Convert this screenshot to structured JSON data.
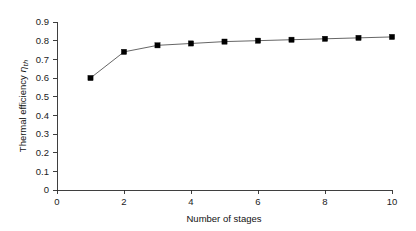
{
  "chart_data": {
    "type": "line",
    "title": "",
    "subtitle": "",
    "xlabel": "Number of stages",
    "ylabel": "Thermal efficiency",
    "ylabel_symbol": "η",
    "ylabel_subscript": "th",
    "x": [
      1,
      2,
      3,
      4,
      5,
      6,
      7,
      8,
      9,
      10
    ],
    "values": [
      0.6,
      0.74,
      0.775,
      0.785,
      0.795,
      0.8,
      0.805,
      0.81,
      0.815,
      0.82
    ],
    "series": [
      {
        "name": "Thermal efficiency",
        "values": [
          0.6,
          0.74,
          0.775,
          0.785,
          0.795,
          0.8,
          0.805,
          0.81,
          0.815,
          0.82
        ],
        "marker": "filled-square",
        "marker_color": "#000000",
        "line_color": "#555555"
      }
    ],
    "xlim": [
      0,
      10
    ],
    "ylim": [
      0,
      0.9
    ],
    "xticks": [
      0,
      2,
      4,
      6,
      8,
      10
    ],
    "xtick_labels": [
      "0",
      "2",
      "4",
      "6",
      "8",
      "10"
    ],
    "yticks": [
      0,
      0.1,
      0.2,
      0.3,
      0.4,
      0.5,
      0.6,
      0.7,
      0.8,
      0.9
    ],
    "ytick_labels": [
      "0",
      "0.1",
      "0.2",
      "0.3",
      "0.4",
      "0.5",
      "0.6",
      "0.7",
      "0.8",
      "0.9"
    ],
    "grid": false,
    "legend": false,
    "legend_position": "none",
    "background_color": "#ffffff",
    "axis_color": "#2a2a2a"
  },
  "layout": {
    "plot_left": 57,
    "plot_right": 392,
    "plot_top": 22,
    "plot_bottom": 190,
    "tick_length": 4,
    "width": 416,
    "height": 231
  }
}
